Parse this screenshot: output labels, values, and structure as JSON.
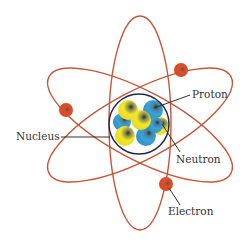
{
  "diagram": {
    "labels": {
      "proton": "Proton",
      "nucleus": "Nucleus",
      "neutron": "Neutron",
      "electron": "Electron"
    },
    "orbit_count": 3,
    "electron_count": 3,
    "colors": {
      "orbit": "#c8553a",
      "electron": "#e0441f",
      "nucleus_ring": "#1e2a48",
      "proton": "#3aa3d8",
      "neutron": "#f2e62a",
      "leader_line": "#333333"
    }
  }
}
